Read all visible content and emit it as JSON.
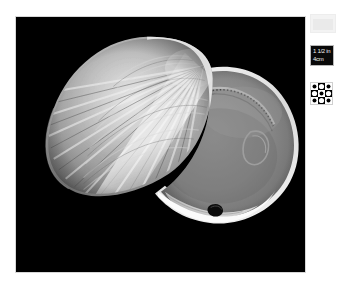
{
  "plate": {
    "background_color": "#ffffff",
    "photo": {
      "background_color": "#000000",
      "border_color": "#d7d7d7",
      "subject": "bivalve-clam-shell-pair",
      "caption": "",
      "alt_text": "Two valves of a bivalve clam shell on a black background"
    }
  },
  "markers": {
    "gray_card": {
      "name": "gray-card",
      "label": "",
      "color": "#eaeaea"
    },
    "scale_bar": {
      "name": "scale-bar",
      "line1": "1 1/2 in",
      "line2": "4cm",
      "background_color": "#090909",
      "text_color": "#f2f2f2"
    },
    "checker_target": {
      "name": "checkerboard-target",
      "label": "",
      "light_color": "#ffffff",
      "dark_color": "#000000"
    }
  }
}
